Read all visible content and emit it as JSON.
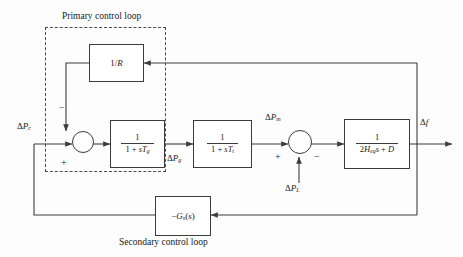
{
  "diagram": {
    "type": "control-block-diagram",
    "annotations": {
      "primary_loop": "Primary control loop",
      "secondary_loop": "Secondary control loop"
    },
    "blocks": [
      {
        "id": "droop",
        "label": "1/R",
        "numerator": "1",
        "denominator": "R",
        "kind": "gain",
        "role": "speed-droop-feedback"
      },
      {
        "id": "governor",
        "label": "1/(1 + sTg)",
        "numerator": "1",
        "denominator": "1 + sT",
        "den_sub": "g",
        "kind": "transfer-function",
        "role": "governor"
      },
      {
        "id": "turbine",
        "label": "1/(1 + sTt)",
        "numerator": "1",
        "denominator": "1 + sT",
        "den_sub": "t",
        "kind": "transfer-function",
        "role": "turbine"
      },
      {
        "id": "power",
        "label": "1/(2Heq s + D)",
        "numerator": "1",
        "denominator": "2H",
        "den_sub": "eq",
        "den_tail": "s + D",
        "kind": "transfer-function",
        "role": "power-system-swing"
      },
      {
        "id": "secondary",
        "label": "-Gs(s)",
        "prefix": "−",
        "base": "G",
        "base_sub": "s",
        "arg": "(s)",
        "kind": "controller",
        "role": "secondary-controller"
      }
    ],
    "summing_junctions": [
      {
        "id": "sum1",
        "inputs": [
          {
            "from": "delta-Pc",
            "sign": "+"
          },
          {
            "from": "droop",
            "sign": "−"
          }
        ]
      },
      {
        "id": "sum2",
        "inputs": [
          {
            "from": "turbine",
            "sign": "+"
          },
          {
            "from": "delta-PL",
            "sign": "−"
          }
        ]
      }
    ],
    "signals": [
      {
        "id": "delta-Pc",
        "label": "ΔP",
        "sub": "c",
        "role": "control-power-setpoint"
      },
      {
        "id": "delta-Pg",
        "label": "ΔP",
        "sub": "g",
        "role": "governor-output-power"
      },
      {
        "id": "delta-Pm",
        "label": "ΔP",
        "sub": "m",
        "role": "mechanical-power"
      },
      {
        "id": "delta-PL",
        "label": "ΔP",
        "sub": "L",
        "role": "load-disturbance"
      },
      {
        "id": "delta-f",
        "label": "Δf",
        "sub": "",
        "role": "frequency-deviation-output"
      }
    ],
    "signs": {
      "minus": "−",
      "plus": "+"
    },
    "colors": {
      "line": "#3c3c3c",
      "dashed": "#4a4a4a",
      "text": "#1a1a1a",
      "background": "#fdfdfd"
    }
  }
}
